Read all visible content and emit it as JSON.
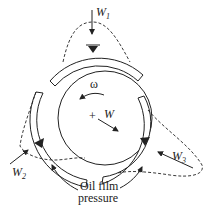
{
  "diagram": {
    "labels": {
      "w1_main": "W",
      "w1_sub": "1",
      "w2_main": "W",
      "w2_sub": "2",
      "w3_main": "W",
      "w3_sub": "3",
      "w_main": "W",
      "omega": "ω",
      "center_mark": "+",
      "caption_line1": "Oil film",
      "caption_line2": "pressure"
    },
    "components": [
      "journal",
      "pad-top",
      "pad-left",
      "pad-right",
      "pivot-top",
      "pivot-left",
      "pivot-right",
      "pressure-profile-1",
      "pressure-profile-2",
      "pressure-profile-3"
    ],
    "colors": {
      "stroke": "#222222",
      "background": "#ffffff"
    }
  }
}
